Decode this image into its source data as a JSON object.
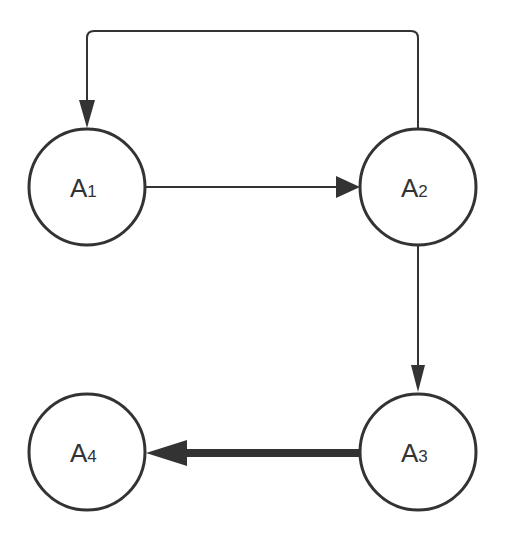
{
  "diagram": {
    "type": "directed-graph",
    "colors": {
      "stroke": "#333333",
      "background": "#ffffff",
      "text": "#333333"
    },
    "nodes": [
      {
        "id": "A1",
        "letter": "A",
        "sub": "1",
        "cx": 87,
        "cy": 187,
        "r": 58
      },
      {
        "id": "A2",
        "letter": "A",
        "sub": "2",
        "cx": 418,
        "cy": 187,
        "r": 58
      },
      {
        "id": "A3",
        "letter": "A",
        "sub": "3",
        "cx": 418,
        "cy": 452,
        "r": 58
      },
      {
        "id": "A4",
        "letter": "A",
        "sub": "4",
        "cx": 87,
        "cy": 452,
        "r": 58
      }
    ],
    "edges": [
      {
        "from": "A1",
        "to": "A2",
        "style": "thin"
      },
      {
        "from": "A2",
        "to": "A1",
        "style": "thin",
        "route": "over-top"
      },
      {
        "from": "A2",
        "to": "A3",
        "style": "thin"
      },
      {
        "from": "A3",
        "to": "A4",
        "style": "thick"
      }
    ]
  }
}
